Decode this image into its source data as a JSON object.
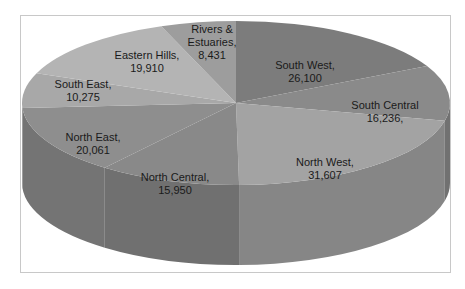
{
  "chart_data": {
    "type": "pie",
    "style": "3d",
    "title": "",
    "legend": "none",
    "categories": [
      "South West",
      "South Central",
      "North West",
      "North Central",
      "North East",
      "South East",
      "Eastern Hills",
      "Rivers & Estuaries"
    ],
    "values": [
      26100,
      16236,
      31607,
      15950,
      20061,
      10275,
      19910,
      8431
    ],
    "labels": [
      {
        "name": "South West",
        "line1": "South West,",
        "line2": "26,100"
      },
      {
        "name": "South Central",
        "line1": "South Central",
        "line2": "16,236,"
      },
      {
        "name": "North West",
        "line1": "North West,",
        "line2": "31,607"
      },
      {
        "name": "North Central",
        "line1": "North Central,",
        "line2": "15,950"
      },
      {
        "name": "North East",
        "line1": "North East,",
        "line2": "20,061"
      },
      {
        "name": "South East",
        "line1": "South East,",
        "line2": "10,275"
      },
      {
        "name": "Eastern Hills",
        "line1": "Eastern Hills,",
        "line2": "19,910"
      },
      {
        "name": "Rivers & Estuaries",
        "line1": "Rivers &",
        "line1b": "Estuaries,",
        "line2": "8,431"
      }
    ],
    "colors": [
      "#7c7c7c",
      "#8a8a8a",
      "#a3a3a3",
      "#898989",
      "#8e8e8e",
      "#a8a8a8",
      "#b4b4b4",
      "#9d9d9d"
    ]
  }
}
